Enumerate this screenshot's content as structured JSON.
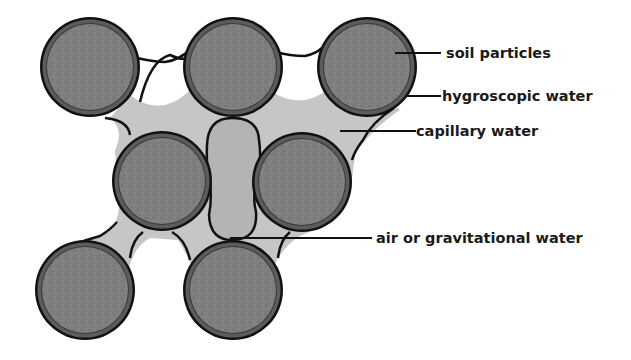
{
  "diagram": {
    "labels": {
      "soil_particles": "soil particles",
      "hygroscopic_water": "hygroscopic water",
      "capillary_water": "capillary water",
      "air_gravitational_water": "air or gravitational water"
    },
    "colors": {
      "particle_fill": "#7d7d7d",
      "hygroscopic_ring": "#5a5a5a",
      "outline": "#111111",
      "capillary_water": "#c4c4c4",
      "air_pocket": "#b2b2b2",
      "background": "#ffffff"
    },
    "particles": [
      {
        "id": 1,
        "cx": 90,
        "cy": 67
      },
      {
        "id": 2,
        "cx": 233,
        "cy": 67
      },
      {
        "id": 3,
        "cx": 367,
        "cy": 67
      },
      {
        "id": 4,
        "cx": 162,
        "cy": 181
      },
      {
        "id": 5,
        "cx": 302,
        "cy": 182
      },
      {
        "id": 6,
        "cx": 85,
        "cy": 290
      },
      {
        "id": 7,
        "cx": 233,
        "cy": 290
      }
    ]
  }
}
